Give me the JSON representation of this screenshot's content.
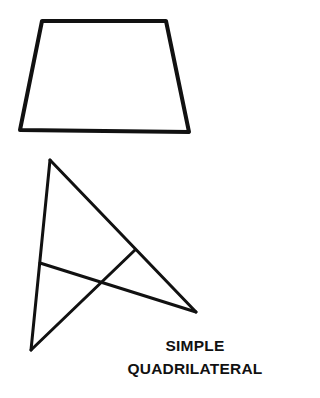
{
  "caption": {
    "line1": "SIMPLE",
    "line2": "QUADRILATERAL"
  },
  "figures": {
    "trapezoid": {
      "points": "42,21 166,21 189,132 20,130",
      "stroke": "#111111"
    },
    "crossed_quadrilateral": {
      "lines": [
        [
          50,
          160,
          196,
          312
        ],
        [
          50,
          160,
          31,
          350
        ],
        [
          31,
          350,
          135,
          250
        ],
        [
          40,
          263,
          196,
          312
        ]
      ],
      "stroke": "#111111"
    }
  }
}
